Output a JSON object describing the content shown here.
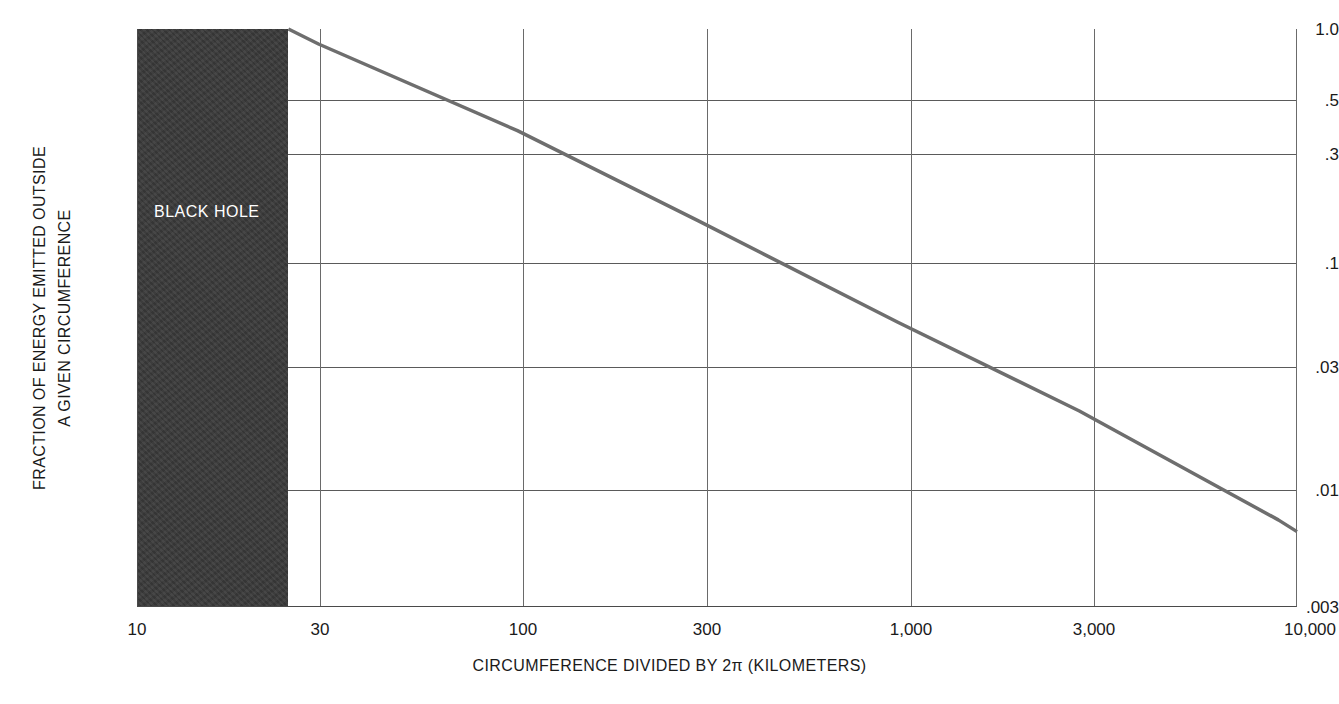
{
  "chart_data": {
    "type": "line",
    "title": "",
    "xlabel": "CIRCUMFERENCE DIVIDED BY 2π (KILOMETERS)",
    "ylabel_line1": "FRACTION OF ENERGY EMITTED OUTSIDE",
    "ylabel_line2": "A GIVEN CIRCUMFERENCE",
    "xscale": "log",
    "yscale": "log",
    "xlim": [
      10,
      11200
    ],
    "ylim": [
      0.003,
      1.0
    ],
    "grid": true,
    "legend": null,
    "xticks": [
      {
        "value": 10,
        "label": "10"
      },
      {
        "value": 30,
        "label": "30"
      },
      {
        "value": 100,
        "label": "100"
      },
      {
        "value": 300,
        "label": "300"
      },
      {
        "value": 1000,
        "label": "1,000"
      },
      {
        "value": 3000,
        "label": "3,000"
      },
      {
        "value": 10000,
        "label": "10,000"
      }
    ],
    "yticks": [
      {
        "value": 1.0,
        "label": "1.0"
      },
      {
        "value": 0.5,
        "label": ".5"
      },
      {
        "value": 0.3,
        "label": ".3"
      },
      {
        "value": 0.1,
        "label": ".1"
      },
      {
        "value": 0.03,
        "label": ".03"
      },
      {
        "value": 0.01,
        "label": ".01"
      },
      {
        "value": 0.003,
        "label": ".003"
      }
    ],
    "series": [
      {
        "name": "fraction of energy emitted outside a given circumference",
        "color": "#6e6e6e",
        "linewidth": 3,
        "points": [
          {
            "x": 25,
            "y": 1.0
          },
          {
            "x": 30,
            "y": 0.86
          },
          {
            "x": 100,
            "y": 0.36
          },
          {
            "x": 300,
            "y": 0.145
          },
          {
            "x": 1000,
            "y": 0.0525
          },
          {
            "x": 3000,
            "y": 0.0215
          },
          {
            "x": 10000,
            "y": 0.0072
          },
          {
            "x": 11200,
            "y": 0.0064
          }
        ]
      }
    ],
    "annotations": [
      {
        "name": "black-hole-region",
        "label": "BLACK HOLE",
        "label_color": "#ffffff",
        "fill_color": "#3a3a3a",
        "x_start": 10,
        "x_end": 25,
        "y_start": 0.003,
        "y_end": 1.0
      }
    ]
  }
}
